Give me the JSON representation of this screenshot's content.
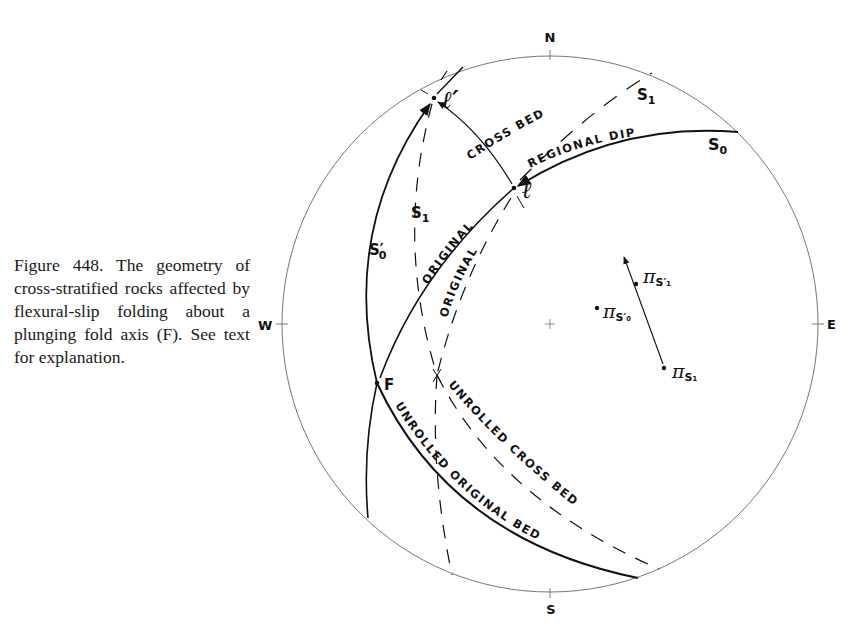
{
  "caption": {
    "text": "Figure 448. The geometry of cross-stratified rocks affected by flexural-slip folding about a plunging fold axis (F). See text for explanation."
  },
  "stereonet": {
    "directions": {
      "north": "N",
      "south": "S",
      "east": "E",
      "west": "W"
    },
    "points": {
      "l_prime": "ℓ′",
      "l": "ℓ",
      "fold_axis": "F",
      "pi_symbol": "π"
    },
    "labels": {
      "s1_top": "S",
      "s1_top_sub": "1",
      "s0": "S",
      "s0_sub": "0",
      "s0_prime": "S′",
      "s0_prime_sub": "0",
      "s1_left": "S",
      "s1_left_sub": "1",
      "pi_s1_prime_sub": "S′₁",
      "pi_s0_prime_sub": "S′₀",
      "pi_s1_sub": "S₁"
    },
    "curve_labels": {
      "cross_bed": "CROSS   BED",
      "regional_dip": "REGIONAL  DIP",
      "original_1": "ORIGINAL",
      "original_2": "ORIGINAL",
      "unrolled_cross_bed": "UNROLLED   CROSS   BED",
      "unrolled_original_bed": "UNROLLED  ORIGINAL    BED"
    }
  }
}
